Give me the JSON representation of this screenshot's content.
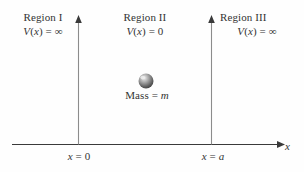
{
  "figure": {
    "title_hidden": "Infinite square well potential diagram",
    "background_color": "#fefefe",
    "line_color": "#3a3a3a"
  },
  "regions": [
    {
      "name": "Region I",
      "potential": "V(x) = ∞"
    },
    {
      "name": "Region II",
      "potential": "V(x) = 0"
    },
    {
      "name": "Region III",
      "potential": "V(x) = ∞"
    }
  ],
  "particle": {
    "label": "Mass = m",
    "shape": "sphere-icon",
    "color": "#8a8a8a",
    "highlight_color": "#e8e8e8"
  },
  "axis": {
    "x_name": "x",
    "ticks": [
      {
        "label": "x = 0"
      },
      {
        "label": "x = a"
      }
    ]
  },
  "chart_data": {
    "type": "line",
    "title": "",
    "xlabel": "x",
    "ylabel": "V(x)",
    "grid": false,
    "legend": "none",
    "xlim": [
      -1,
      2
    ],
    "ylim": [
      0,
      1
    ],
    "annotations": [
      {
        "text": "Region I",
        "x": -0.6,
        "y": 0.95
      },
      {
        "text": "V(x) = ∞",
        "x": -0.6,
        "y": 0.85
      },
      {
        "text": "Region II",
        "x": 0.5,
        "y": 0.95
      },
      {
        "text": "V(x) = 0",
        "x": 0.5,
        "y": 0.85
      },
      {
        "text": "Region III",
        "x": 1.6,
        "y": 0.95
      },
      {
        "text": "V(x) = ∞",
        "x": 1.6,
        "y": 0.85
      },
      {
        "text": "Mass = m",
        "x": 0.5,
        "y": 0.38
      },
      {
        "text": "x = 0",
        "x": 0.0,
        "y": -0.06
      },
      {
        "text": "x = a",
        "x": 1.0,
        "y": -0.06
      }
    ],
    "series": [
      {
        "name": "potential-wall-left",
        "x": [
          0,
          0
        ],
        "y": [
          0,
          1
        ]
      },
      {
        "name": "potential-well-floor",
        "x": [
          0,
          1
        ],
        "y": [
          0,
          0
        ]
      },
      {
        "name": "potential-wall-right",
        "x": [
          1,
          1
        ],
        "y": [
          0,
          1
        ]
      }
    ]
  }
}
